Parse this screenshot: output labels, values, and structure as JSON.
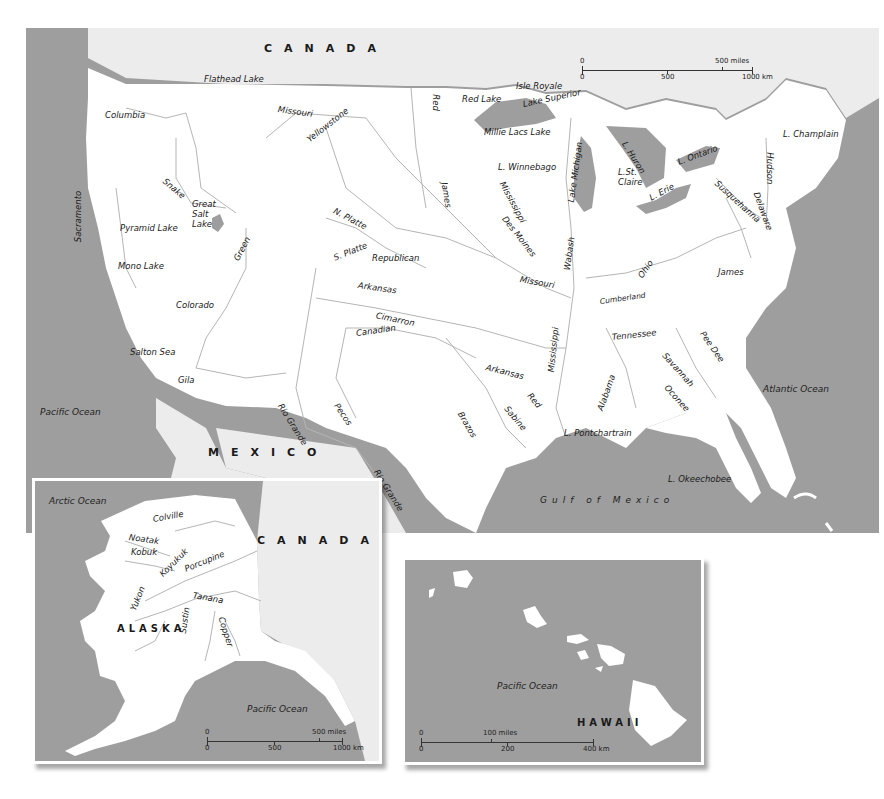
{
  "colors": {
    "water": "#9e9e9e",
    "land_us": "#ffffff",
    "land_foreign": "#ececec",
    "river": "#b5b5b5",
    "label": "#1a1a1a",
    "border": "#ffffff"
  },
  "main_map": {
    "countries": {
      "north": "CANADA",
      "south": "MEXICO"
    },
    "oceans": {
      "west": "Pacific Ocean",
      "east": "Atlantic Ocean",
      "gulf": "Gulf of Mexico"
    },
    "scale": {
      "miles_zero": "0",
      "miles_label": "500 miles",
      "km_zero": "0",
      "km_mid": "500",
      "km_label": "1000 km"
    },
    "lakes": {
      "flathead": "Flathead Lake",
      "great_salt": "Great Salt Lake",
      "great_salt_l1": "Great",
      "great_salt_l2": "Salt",
      "great_salt_l3": "Lake",
      "pyramid": "Pyramid Lake",
      "mono": "Mono Lake",
      "salton": "Salton Sea",
      "red_lake": "Red Lake",
      "isle_royale": "Isle Royale",
      "superior": "Lake Superior",
      "millie_lacs": "Millie Lacs Lake",
      "winnebago": "L. Winnebago",
      "michigan": "Lake Michigan",
      "huron": "L. Huron",
      "st_claire_l1": "L.St.",
      "st_claire_l2": "Claire",
      "erie": "L. Erie",
      "ontario": "L. Ontario",
      "champlain": "L. Champlain",
      "pontchartrain": "L. Pontchartrain",
      "okeechobee": "L. Okeechobee"
    },
    "rivers": {
      "columbia": "Columbia",
      "missouri_upper": "Missouri",
      "yellowstone": "Yellowstone",
      "snake": "Snake",
      "sacramento": "Sacramento",
      "green": "Green",
      "colorado": "Colorado",
      "gila": "Gila",
      "rio_grande_1": "Rio Grande",
      "rio_grande_2": "Rio Grande",
      "pecos": "Pecos",
      "n_platte": "N. Platte",
      "s_platte": "S. Platte",
      "republican": "Republican",
      "arkansas_1": "Arkansas",
      "arkansas_2": "Arkansas",
      "cimarron": "Cimarron",
      "canadian": "Canadian",
      "red_north": "Red",
      "james_west": "James",
      "mississippi_upper": "Mississippi",
      "des_moines": "Des Moines",
      "missouri_lower": "Missouri",
      "wabash": "Wabash",
      "ohio": "Ohio",
      "cumberland": "Cumberland",
      "tennessee": "Tennessee",
      "mississippi_lower": "Mississippi",
      "red_south": "Red",
      "sabine": "Sabine",
      "brazos": "Brazos",
      "alabama": "Alabama",
      "savannah": "Savannah",
      "oconee": "Oconee",
      "pee_dee": "Pee Dee",
      "james_east": "James",
      "susquehanna": "Susquehanna",
      "delaware": "Delaware",
      "hudson": "Hudson"
    }
  },
  "alaska_inset": {
    "state": "ALASKA",
    "country": "CANADA",
    "oceans": {
      "north": "Arctic Ocean",
      "south": "Pacific Ocean"
    },
    "rivers": {
      "colville": "Colville",
      "noatak": "Noatak",
      "kobuk": "Kobuk",
      "koyukuk": "Koyukuk",
      "porcupine": "Porcupine",
      "tanana": "Tanana",
      "yukon": "Yukon",
      "sustin": "Sustin",
      "copper": "Copper"
    },
    "scale": {
      "miles_zero": "0",
      "miles_label": "500 miles",
      "km_zero": "0",
      "km_mid": "500",
      "km_label": "1000 km"
    }
  },
  "hawaii_inset": {
    "state": "HAWAII",
    "ocean": "Pacific Ocean",
    "scale": {
      "miles_zero": "0",
      "miles_label": "100 miles",
      "km_zero": "0",
      "km_mid": "200",
      "km_label": "400 km"
    }
  }
}
